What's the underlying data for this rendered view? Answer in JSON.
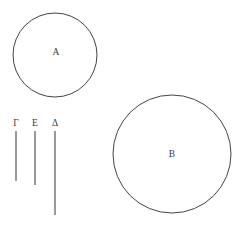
{
  "canvas": {
    "width": 240,
    "height": 229,
    "background": "#ffffff",
    "stroke_color": "#444444",
    "text_color": "#3a3a3a"
  },
  "figure": {
    "title": "",
    "circles": [
      {
        "label": "A",
        "cx": 55,
        "cy": 55,
        "r": 42,
        "label_x": 56,
        "label_y": 53
      },
      {
        "label": "B",
        "cx": 172,
        "cy": 154,
        "r": 59,
        "label_x": 172,
        "label_y": 155
      }
    ],
    "segments": [
      {
        "label": "Γ",
        "x": 16,
        "y1": 131,
        "y2": 181,
        "label_x": 16,
        "label_y": 126
      },
      {
        "label": "Ε",
        "x": 35,
        "y1": 131,
        "y2": 185,
        "label_x": 35,
        "label_y": 126
      },
      {
        "label": "Δ",
        "x": 55,
        "y1": 131,
        "y2": 215,
        "label_x": 55,
        "label_y": 126
      }
    ]
  }
}
